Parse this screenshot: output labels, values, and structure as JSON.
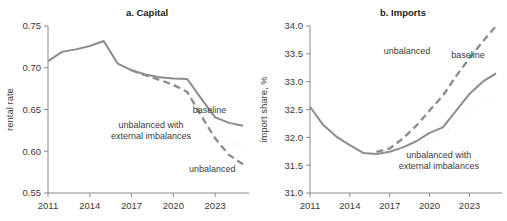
{
  "figure": {
    "background": "#ffffff",
    "panels": [
      "a",
      "b"
    ]
  },
  "colors": {
    "baseline": "#8c8c8c",
    "unbalanced": "#8c8c8c",
    "unbalanced_external": "#b5b5b5",
    "axis": "#8a8a8a",
    "text": "#3a3a3a",
    "title": "#1a1a1a"
  },
  "chart_data": [
    {
      "type": "line",
      "panel": "a",
      "title": "a. Capital",
      "xlabel": "",
      "ylabel": "rental rate",
      "xlim": [
        2011,
        2025
      ],
      "ylim": [
        0.55,
        0.75
      ],
      "xticks": [
        2011,
        2014,
        2017,
        2020,
        2023
      ],
      "xtick_labels": [
        "2011",
        "2014",
        "2017",
        "2020",
        "2023"
      ],
      "yticks": [
        0.55,
        0.6,
        0.65,
        0.7,
        0.75
      ],
      "ytick_labels": [
        "0.55",
        "0.60",
        "0.65",
        "0.70",
        "0.75"
      ],
      "grid": false,
      "legend": "in-plot annotations",
      "series": [
        {
          "name": "baseline",
          "style": "solid",
          "color": "#8c8c8c",
          "label": "baseline",
          "label_x": 2022.6,
          "label_y": 0.6455,
          "x": [
            2011,
            2012,
            2013,
            2014,
            2015,
            2016,
            2017,
            2018,
            2019,
            2020,
            2021,
            2022,
            2023,
            2024,
            2025
          ],
          "values": [
            0.708,
            0.719,
            0.722,
            0.726,
            0.732,
            0.705,
            0.697,
            0.692,
            0.6885,
            0.687,
            0.6865,
            0.663,
            0.6405,
            0.634,
            0.6305
          ]
        },
        {
          "name": "unbalanced",
          "style": "dashed",
          "color": "#8c8c8c",
          "label": "unbalanced",
          "label_x": 2022.8,
          "label_y": 0.5755,
          "x": [
            2017,
            2018,
            2019,
            2020,
            2021,
            2022,
            2023,
            2024,
            2025
          ],
          "values": [
            0.697,
            0.691,
            0.6855,
            0.6795,
            0.671,
            0.6425,
            0.6155,
            0.5955,
            0.5845
          ]
        },
        {
          "name": "unbalanced with external imbalances",
          "style": "dotted",
          "color": "#b5b5b5",
          "label": "unbalanced with\nexternal imbalances",
          "label_x": 2018.4,
          "label_y": 0.6275,
          "x": [
            2017,
            2018,
            2019,
            2020,
            2021,
            2022,
            2023,
            2024,
            2025
          ],
          "values": [
            0.697,
            0.6915,
            0.6865,
            0.6815,
            0.674,
            0.6495,
            0.6265,
            0.6125,
            0.6045
          ]
        }
      ]
    },
    {
      "type": "line",
      "panel": "b",
      "title": "b. Imports",
      "xlabel": "",
      "ylabel": "import share, %",
      "xlim": [
        2011,
        2025
      ],
      "ylim": [
        31.0,
        34.0
      ],
      "xticks": [
        2011,
        2014,
        2017,
        2020,
        2023
      ],
      "xtick_labels": [
        "2011",
        "2014",
        "2017",
        "2020",
        "2023"
      ],
      "yticks": [
        31.0,
        31.5,
        32.0,
        32.5,
        33.0,
        33.5,
        34.0
      ],
      "ytick_labels": [
        "31.0",
        "31.5",
        "32.0",
        "32.5",
        "33.0",
        "33.5",
        "34.0"
      ],
      "grid": false,
      "legend": "in-plot annotations",
      "series": [
        {
          "name": "baseline",
          "style": "solid",
          "color": "#8c8c8c",
          "label": "baseline",
          "label_x": 2022.9,
          "label_y": 33.42,
          "x": [
            2011,
            2012,
            2013,
            2014,
            2015,
            2016,
            2017,
            2018,
            2019,
            2020,
            2021,
            2022,
            2023,
            2024,
            2025
          ],
          "values": [
            32.55,
            32.22,
            32.01,
            31.86,
            31.72,
            31.7,
            31.74,
            31.82,
            31.93,
            32.08,
            32.18,
            32.48,
            32.78,
            33.0,
            33.15
          ]
        },
        {
          "name": "unbalanced",
          "style": "dashed",
          "color": "#8c8c8c",
          "label": "unbalanced",
          "label_x": 2018.3,
          "label_y": 33.49,
          "x": [
            2016,
            2017,
            2018,
            2019,
            2020,
            2021,
            2022,
            2023,
            2024,
            2025
          ],
          "values": [
            31.74,
            31.8,
            31.98,
            32.21,
            32.48,
            32.75,
            33.1,
            33.42,
            33.72,
            34.0
          ]
        },
        {
          "name": "unbalanced with external imbalances",
          "style": "dotted",
          "color": "#b5b5b5",
          "label": "unbalanced with\nexternal imbalances",
          "label_x": 2020.7,
          "label_y": 31.62,
          "x": [
            2016,
            2017,
            2018,
            2019,
            2020,
            2021,
            2022,
            2023,
            2024,
            2025
          ],
          "values": [
            31.73,
            31.76,
            31.82,
            31.88,
            31.96,
            32.07,
            32.29,
            32.49,
            32.64,
            32.75
          ]
        }
      ]
    }
  ]
}
